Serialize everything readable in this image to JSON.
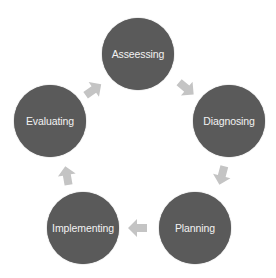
{
  "diagram": {
    "type": "cycle",
    "node_color": "#5a5a5a",
    "text_color": "#f2f2f2",
    "arrow_color": "#c4c4c4",
    "nodes": [
      {
        "label": "Asseessing",
        "cx": 138,
        "cy": 54
      },
      {
        "label": "Diagnosing",
        "cx": 229,
        "cy": 121
      },
      {
        "label": "Planning",
        "cx": 195,
        "cy": 228
      },
      {
        "label": "Implementing",
        "cx": 83,
        "cy": 228
      },
      {
        "label": "Evaluating",
        "cx": 50,
        "cy": 121
      }
    ],
    "edges": [
      {
        "from": "Asseessing",
        "to": "Diagnosing"
      },
      {
        "from": "Diagnosing",
        "to": "Planning"
      },
      {
        "from": "Planning",
        "to": "Implementing"
      },
      {
        "from": "Implementing",
        "to": "Evaluating"
      },
      {
        "from": "Evaluating",
        "to": "Asseessing"
      }
    ]
  }
}
